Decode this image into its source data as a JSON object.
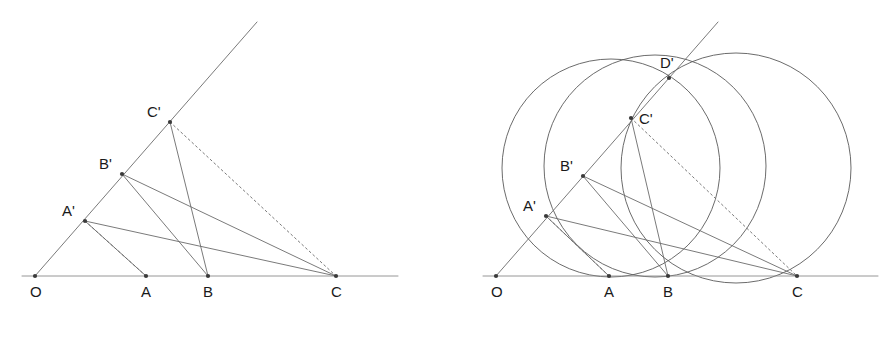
{
  "canvas": {
    "width": 893,
    "height": 338,
    "background": "#ffffff"
  },
  "style": {
    "line_color": "#6b6b6b",
    "axis_color": "#8a8a8a",
    "circle_color": "#5a5a5a",
    "point_color": "#3a3a3a",
    "label_color": "#1a1a1a",
    "line_width": 0.9,
    "dash_pattern": "2,3"
  },
  "figures": [
    {
      "id": "left-figure",
      "name": "similar-triangles-construction",
      "points": [
        {
          "id": "O",
          "label": "O",
          "x": 35,
          "y": 276,
          "label_x": 30,
          "label_y": 297
        },
        {
          "id": "A",
          "label": "A",
          "x": 146,
          "y": 276,
          "label_x": 141,
          "label_y": 297
        },
        {
          "id": "B",
          "label": "B",
          "x": 208,
          "y": 276,
          "label_x": 203,
          "label_y": 297
        },
        {
          "id": "C",
          "label": "C",
          "x": 336,
          "y": 276,
          "label_x": 331,
          "label_y": 297
        },
        {
          "id": "Ap",
          "label": "A'",
          "x": 85,
          "y": 221,
          "label_x": 62,
          "label_y": 216
        },
        {
          "id": "Bp",
          "label": "B'",
          "x": 122,
          "y": 174,
          "label_x": 99,
          "label_y": 169
        },
        {
          "id": "Cp",
          "label": "C'",
          "x": 170,
          "y": 122,
          "label_x": 147,
          "label_y": 117
        }
      ],
      "baseline": {
        "x1": 22,
        "y1": 276,
        "x2": 398,
        "y2": 276
      },
      "ray": {
        "x1": 35,
        "y1": 276,
        "x2": 257,
        "y2": 22
      },
      "solid_segments": [
        {
          "name": "Ap-C",
          "x1": 85,
          "y1": 221,
          "x2": 336,
          "y2": 276
        },
        {
          "name": "Bp-C",
          "x1": 122,
          "y1": 174,
          "x2": 336,
          "y2": 276
        },
        {
          "name": "Ap-A",
          "x1": 85,
          "y1": 221,
          "x2": 146,
          "y2": 276
        },
        {
          "name": "Bp-B",
          "x1": 122,
          "y1": 174,
          "x2": 208,
          "y2": 276
        },
        {
          "name": "Cp-B",
          "x1": 170,
          "y1": 122,
          "x2": 208,
          "y2": 276
        }
      ],
      "dashed_segments": [
        {
          "name": "Ap-A-dashed",
          "x1": 85,
          "y1": 221,
          "x2": 146,
          "y2": 276
        },
        {
          "name": "Cp-C-dashed",
          "x1": 170,
          "y1": 122,
          "x2": 336,
          "y2": 276
        }
      ]
    },
    {
      "id": "right-figure",
      "name": "circumcircles-construction",
      "points": [
        {
          "id": "O",
          "label": "O",
          "x": 496,
          "y": 276,
          "label_x": 491,
          "label_y": 297
        },
        {
          "id": "A",
          "label": "A",
          "x": 609,
          "y": 276,
          "label_x": 604,
          "label_y": 297
        },
        {
          "id": "B",
          "label": "B",
          "x": 668,
          "y": 276,
          "label_x": 663,
          "label_y": 297
        },
        {
          "id": "C",
          "label": "C",
          "x": 797,
          "y": 276,
          "label_x": 792,
          "label_y": 297
        },
        {
          "id": "Ap",
          "label": "A'",
          "x": 546,
          "y": 216,
          "label_x": 523,
          "label_y": 211
        },
        {
          "id": "Bp",
          "label": "B'",
          "x": 583,
          "y": 176,
          "label_x": 560,
          "label_y": 171
        },
        {
          "id": "Cp",
          "label": "C'",
          "x": 631,
          "y": 118,
          "label_x": 639,
          "label_y": 124
        },
        {
          "id": "Dp",
          "label": "D'",
          "x": 669,
          "y": 78,
          "label_x": 660,
          "label_y": 68
        }
      ],
      "baseline": {
        "x1": 483,
        "y1": 276,
        "x2": 878,
        "y2": 276
      },
      "ray": {
        "x1": 496,
        "y1": 276,
        "x2": 718,
        "y2": 22
      },
      "solid_segments": [
        {
          "name": "Ap-C",
          "x1": 546,
          "y1": 216,
          "x2": 797,
          "y2": 276
        },
        {
          "name": "Bp-C",
          "x1": 583,
          "y1": 176,
          "x2": 797,
          "y2": 276
        },
        {
          "name": "Ap-A",
          "x1": 546,
          "y1": 216,
          "x2": 609,
          "y2": 276
        },
        {
          "name": "Bp-B",
          "x1": 583,
          "y1": 176,
          "x2": 668,
          "y2": 276
        },
        {
          "name": "Cp-B",
          "x1": 631,
          "y1": 118,
          "x2": 668,
          "y2": 276
        }
      ],
      "dashed_segments": [
        {
          "name": "Ap-A-dashed",
          "x1": 546,
          "y1": 216,
          "x2": 609,
          "y2": 276
        },
        {
          "name": "Cp-C-dashed",
          "x1": 631,
          "y1": 118,
          "x2": 797,
          "y2": 276
        }
      ],
      "circles": [
        {
          "name": "circle-through-A-and-Dprime",
          "cx": 611,
          "cy": 168,
          "r": 109
        },
        {
          "name": "circle-through-B-and-Dprime",
          "cx": 655,
          "cy": 166,
          "r": 111
        },
        {
          "name": "circle-through-C-and-Dprime",
          "cx": 736,
          "cy": 168,
          "r": 115
        }
      ]
    }
  ]
}
